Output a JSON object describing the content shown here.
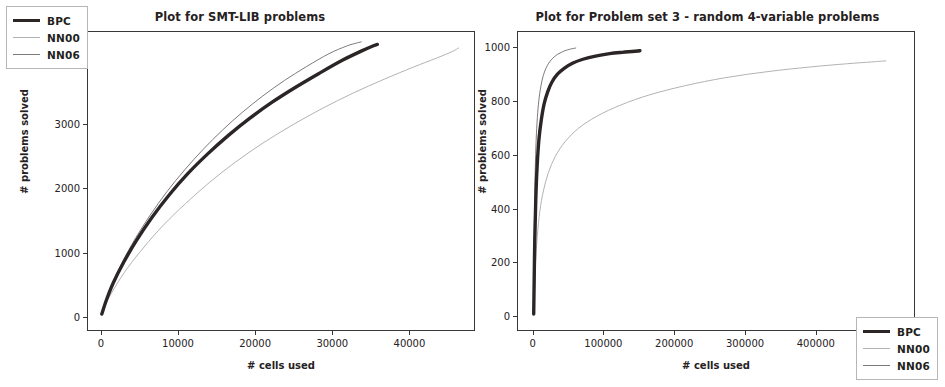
{
  "figure": {
    "background": "#ffffff",
    "axis_color": "#3a3537",
    "text_color": "#262122"
  },
  "series_style": {
    "BPC": {
      "color": "#2b2526",
      "width": 3.4
    },
    "NN00": {
      "color": "#b4b0b1",
      "width": 1.0
    },
    "NN06": {
      "color": "#7d7879",
      "width": 1.0
    }
  },
  "panels": {
    "left": {
      "legend": {
        "position": "upper-left",
        "entries": [
          "BPC",
          "NN00",
          "NN06"
        ]
      },
      "xticks": [
        "0",
        "10000",
        "20000",
        "30000",
        "40000"
      ],
      "yticks": [
        "0",
        "1000",
        "2000",
        "3000",
        "4000"
      ]
    },
    "right": {
      "legend": {
        "position": "lower-right",
        "entries": [
          "BPC",
          "NN00",
          "NN06"
        ]
      },
      "xticks": [
        "0",
        "100000",
        "200000",
        "300000",
        "400000",
        "500000"
      ],
      "yticks": [
        "0",
        "200",
        "400",
        "600",
        "800",
        "1000"
      ]
    }
  },
  "chart_data": [
    {
      "type": "line",
      "title": "Plot for SMT-LIB problems",
      "xlabel": "# cells used",
      "ylabel": "# problems solved",
      "xlim": [
        -1800,
        48500
      ],
      "ylim": [
        -220,
        4450
      ],
      "xticks": [
        0,
        10000,
        20000,
        30000,
        40000
      ],
      "yticks": [
        0,
        1000,
        2000,
        3000,
        4000
      ],
      "grid": false,
      "legend_position": "upper left",
      "series": [
        {
          "name": "BPC",
          "x": [
            0,
            600,
            1500,
            2800,
            4500,
            6500,
            8800,
            11200,
            13800,
            16500,
            19300,
            22200,
            25200,
            28300,
            31400,
            33800,
            35400,
            35900
          ],
          "y": [
            30,
            250,
            520,
            830,
            1180,
            1540,
            1900,
            2230,
            2540,
            2830,
            3100,
            3350,
            3580,
            3800,
            4010,
            4150,
            4235,
            4255
          ]
        },
        {
          "name": "NN06",
          "x": [
            0,
            580,
            1450,
            2700,
            4350,
            6300,
            8500,
            10800,
            13200,
            15700,
            18300,
            21000,
            23800,
            26700,
            29600,
            31900,
            33300,
            33800
          ],
          "y": [
            30,
            255,
            530,
            850,
            1210,
            1580,
            1950,
            2290,
            2610,
            2910,
            3190,
            3450,
            3690,
            3910,
            4110,
            4230,
            4280,
            4295
          ]
        },
        {
          "name": "NN00",
          "x": [
            0,
            700,
            1800,
            3400,
            5500,
            8000,
            10900,
            14000,
            17400,
            21000,
            24800,
            28700,
            32700,
            36800,
            40600,
            43600,
            45600,
            46500
          ],
          "y": [
            30,
            230,
            470,
            760,
            1080,
            1420,
            1760,
            2090,
            2410,
            2710,
            2990,
            3250,
            3490,
            3710,
            3900,
            4040,
            4140,
            4200
          ]
        }
      ]
    },
    {
      "type": "line",
      "title": "Plot for Problem set 3 - random 4-variable problems",
      "xlabel": "# cells used",
      "ylabel": "# problems solved",
      "xlim": [
        -22000,
        540000
      ],
      "ylim": [
        -55,
        1060
      ],
      "xticks": [
        0,
        100000,
        200000,
        300000,
        400000,
        500000
      ],
      "yticks": [
        0,
        200,
        400,
        600,
        800,
        1000
      ],
      "grid": false,
      "legend_position": "lower right",
      "series": [
        {
          "name": "BPC",
          "x": [
            300,
            900,
            1800,
            3200,
            5200,
            7800,
            11000,
            15000,
            20000,
            26000,
            34000,
            44000,
            56000,
            70000,
            88000,
            108000,
            126000,
            140000,
            148000,
            151000
          ],
          "y": [
            5,
            120,
            280,
            430,
            560,
            660,
            730,
            790,
            835,
            872,
            902,
            925,
            944,
            958,
            970,
            979,
            984,
            987,
            989,
            990
          ]
        },
        {
          "name": "NN06",
          "x": [
            200,
            600,
            1200,
            2100,
            3400,
            5000,
            7000,
            9400,
            12200,
            15500,
            19500,
            24000,
            29000,
            34500,
            41000,
            48000,
            54000,
            58000,
            60000
          ],
          "y": [
            5,
            150,
            330,
            500,
            630,
            720,
            790,
            840,
            880,
            910,
            934,
            952,
            966,
            977,
            986,
            993,
            997,
            999,
            1000
          ]
        },
        {
          "name": "NN00",
          "x": [
            400,
            1400,
            3000,
            5500,
            9000,
            14000,
            21000,
            31000,
            45000,
            64000,
            90000,
            124000,
            165000,
            215000,
            272000,
            333000,
            392000,
            444000,
            480000,
            500000
          ],
          "y": [
            5,
            90,
            200,
            300,
            390,
            465,
            533,
            595,
            650,
            700,
            745,
            787,
            825,
            859,
            889,
            912,
            929,
            941,
            948,
            952
          ]
        }
      ]
    }
  ]
}
